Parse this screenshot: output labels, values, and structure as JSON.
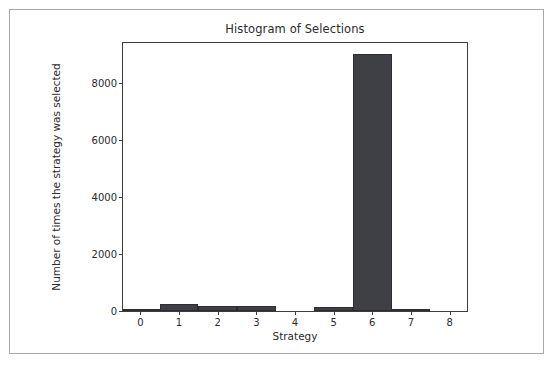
{
  "figure": {
    "title": "Histogram of Selections",
    "background": "#ffffff",
    "frame_color": "#a9a9a9",
    "axes_color": "#3c3c3c"
  },
  "chart_data": {
    "type": "bar",
    "title": "Histogram of Selections",
    "xlabel": "Strategy",
    "ylabel": "Number of times the strategy was selected",
    "categories": [
      "0",
      "1",
      "2",
      "3",
      "4",
      "5",
      "6",
      "7",
      "8"
    ],
    "values": [
      20,
      230,
      180,
      160,
      0,
      150,
      9000,
      60,
      0
    ],
    "x": [
      0,
      1,
      2,
      3,
      4,
      5,
      6,
      7,
      8
    ],
    "xlim": [
      -0.45,
      8.45
    ],
    "ylim": [
      0,
      9400
    ],
    "xticks": [
      "0",
      "1",
      "2",
      "3",
      "4",
      "5",
      "6",
      "7",
      "8"
    ],
    "yticks": [
      "0",
      "2000",
      "4000",
      "6000",
      "8000"
    ],
    "ytick_values": [
      0,
      2000,
      4000,
      6000,
      8000
    ],
    "bar_color": "#3f3f46",
    "bar_edge_color": "#2c2c32",
    "grid": false,
    "legend": null
  },
  "axis": {
    "x_label": "Strategy",
    "y_label": "Number of times the strategy was selected"
  }
}
